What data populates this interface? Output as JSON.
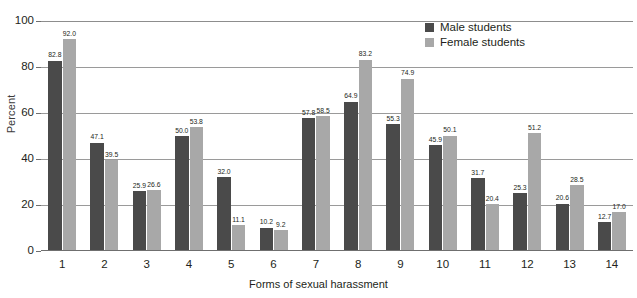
{
  "chart_data": {
    "type": "bar",
    "title": "",
    "xlabel": "Forms of sexual harassment",
    "ylabel": "Percent",
    "ylim": [
      0,
      100
    ],
    "yticks": [
      0,
      20,
      40,
      60,
      80,
      100
    ],
    "grid": true,
    "legend_position": "top-right",
    "categories": [
      "1",
      "2",
      "3",
      "4",
      "5",
      "6",
      "7",
      "8",
      "9",
      "10",
      "11",
      "12",
      "13",
      "14"
    ],
    "series": [
      {
        "name": "Male students",
        "color": "#4a4a4a",
        "values": [
          82.8,
          47.1,
          25.9,
          50.0,
          32.0,
          10.2,
          57.8,
          64.9,
          55.3,
          45.9,
          31.7,
          25.3,
          20.6,
          12.7
        ],
        "labels": [
          "82.8",
          "47.1",
          "25.9",
          "50.0",
          "32.0",
          "10.2",
          "57.8",
          "64.9",
          "55.3",
          "45.9",
          "31.7",
          "25.3",
          "20.6",
          "12.7"
        ]
      },
      {
        "name": "Female students",
        "color": "#a8a8a8",
        "values": [
          92.0,
          39.5,
          26.6,
          53.8,
          11.1,
          9.2,
          58.5,
          83.2,
          74.9,
          50.1,
          20.4,
          51.2,
          28.5,
          17.0
        ],
        "labels": [
          "92.0",
          "39.5",
          "26.6",
          "53.8",
          "11.1",
          "9.2",
          "58.5",
          "83.2",
          "74.9",
          "50.1",
          "20.4",
          "51.2",
          "28.5",
          "17.0"
        ]
      }
    ]
  },
  "legend": {
    "items": [
      {
        "label": "Male students",
        "swatch": "male"
      },
      {
        "label": "Female students",
        "swatch": "female"
      }
    ]
  },
  "axes": {
    "y_label": "Percent",
    "y_tick_labels": [
      "100",
      "80",
      "60",
      "40",
      "20",
      "0"
    ],
    "x_label": "Forms of sexual harassment",
    "x_tick_labels": [
      "1",
      "2",
      "3",
      "4",
      "5",
      "6",
      "7",
      "8",
      "9",
      "10",
      "11",
      "12",
      "13",
      "14"
    ]
  }
}
